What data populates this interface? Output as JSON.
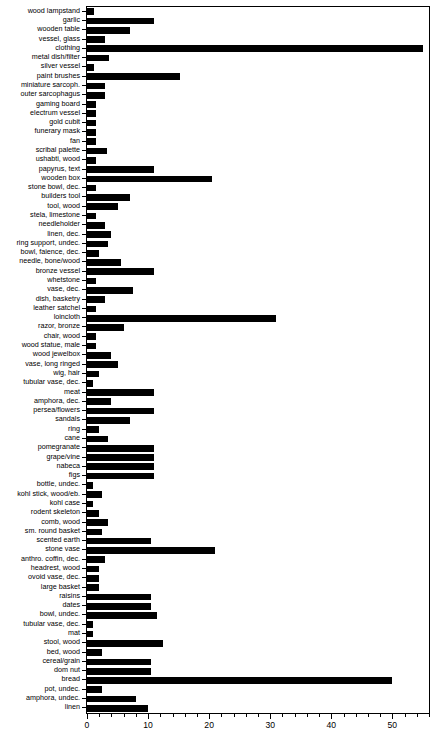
{
  "chart_data": {
    "type": "bar",
    "orientation": "horizontal",
    "title": "",
    "subtitle": "",
    "xlabel": "",
    "ylabel": "",
    "xlim": [
      0,
      56
    ],
    "ylim": null,
    "grid": false,
    "legend": null,
    "bar_color": "#000000",
    "axis_color": "#000000",
    "background": "#ffffff",
    "xticks_major": [
      0,
      10,
      20,
      30,
      40,
      50
    ],
    "xtick_labels": [
      "0",
      "10",
      "20",
      "30",
      "40",
      "50"
    ],
    "xtick_minor_step": 2,
    "categories": [
      "wood lampstand",
      "garlic",
      "wooden table",
      "vessel, glass",
      "clothing",
      "metal dish/filter",
      "silver vessel",
      "paint brushes",
      "miniature sarcoph.",
      "outer sarcophagus",
      "gaming board",
      "electrum vessel",
      "gold cubit",
      "funerary mask",
      "fan",
      "scribal palette",
      "ushabti, wood",
      "papyrus, text",
      "wooden box",
      "stone bowl, dec.",
      "builders tool",
      "tool, wood",
      "stela, limestone",
      "needleholder",
      "linen, dec.",
      "ring support, undec.",
      "bowl, faience, dec.",
      "needle, bone/wood",
      "bronze vessel",
      "whetstone",
      "vase, dec.",
      "dish, basketry",
      "leather satchel",
      "loincloth",
      "razor, bronze",
      "chair, wood",
      "wood statue, male",
      "wood jewelbox",
      "vase, long ringed",
      "wig, hair",
      "tubular vase, dec.",
      "meat",
      "amphora, dec.",
      "persea/flowers",
      "sandals",
      "ring",
      "cane",
      "pomegranate",
      "grape/vine",
      "nabeca",
      "figs",
      "bottle, undec.",
      "kohl stick, wood/eb.",
      "kohl case",
      "rodent skeleton",
      "comb, wood",
      "sm. round basket",
      "scented earth",
      "stone vase",
      "anthro. coffin, dec.",
      "headrest, wood",
      "ovoid vase, dec.",
      "large basket",
      "raisins",
      "dates",
      "bowl, undec.",
      "tubular vase, dec.",
      "mat",
      "stool, wood",
      "bed, wood",
      "cereal/grain",
      "dom nut",
      "bread",
      "pot, undec.",
      "amphora, undec.",
      "linen"
    ],
    "values": [
      1.2,
      11.0,
      7.0,
      3.0,
      55.0,
      3.6,
      1.2,
      15.3,
      3.0,
      3.0,
      1.5,
      1.5,
      1.5,
      1.5,
      1.5,
      3.2,
      1.5,
      11.0,
      20.5,
      1.5,
      7.0,
      5.0,
      1.5,
      3.0,
      4.0,
      3.5,
      2.0,
      5.5,
      11.0,
      1.5,
      7.5,
      3.0,
      1.5,
      31.0,
      6.0,
      1.5,
      1.5,
      4.0,
      5.0,
      2.0,
      1.0,
      11.0,
      4.0,
      11.0,
      7.0,
      2.0,
      3.5,
      11.0,
      11.0,
      11.0,
      11.0,
      1.0,
      2.5,
      1.0,
      2.0,
      3.5,
      2.5,
      10.5,
      21.0,
      3.0,
      2.0,
      2.0,
      2.0,
      10.5,
      10.5,
      11.5,
      1.0,
      1.0,
      12.5,
      2.5,
      10.5,
      10.5,
      50.0,
      2.5,
      8.0,
      10.0
    ]
  }
}
